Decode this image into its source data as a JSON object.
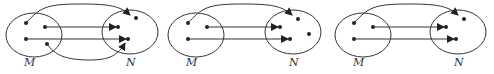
{
  "diagrams": [
    {
      "id": "diagram-1",
      "sets": {
        "M": {
          "label": "M",
          "cx": 34,
          "cy": 35,
          "rx": 28,
          "ry": 22,
          "label_pos": [
            24,
            66
          ],
          "points": [
            [
              26,
              23
            ],
            [
              45,
              27
            ],
            [
              26,
              39
            ],
            [
              47,
              44
            ]
          ]
        },
        "N": {
          "label": "N",
          "cx": 130,
          "cy": 32,
          "rx": 28,
          "ry": 22,
          "label_pos": [
            126,
            66
          ],
          "points": [
            [
              136,
              18
            ],
            [
              118,
              27
            ],
            [
              128,
              39
            ]
          ]
        }
      },
      "arrows": [
        {
          "from": [
            26,
            23
          ],
          "to": [
            130,
            15
          ],
          "path": "M26,23 C40,8 45,4 80,4 C110,4 120,6 130,15"
        },
        {
          "from": [
            45,
            27
          ],
          "to": [
            116,
            27
          ],
          "path": "M45,27 L116,27"
        },
        {
          "from": [
            26,
            39
          ],
          "to": [
            126,
            39
          ],
          "path": "M26,39 L126,39"
        },
        {
          "from": [
            47,
            44
          ],
          "to": [
            125,
            43
          ],
          "path": "M47,44 C55,55 65,60 90,60 C110,60 118,55 125,43"
        }
      ]
    },
    {
      "id": "diagram-2",
      "sets": {
        "M": {
          "label": "M",
          "cx": 196,
          "cy": 35,
          "rx": 28,
          "ry": 22,
          "label_pos": [
            186,
            66
          ],
          "points": [
            [
              188,
              23
            ],
            [
              207,
              27
            ],
            [
              188,
              39
            ]
          ]
        },
        "N": {
          "label": "N",
          "cx": 293,
          "cy": 32,
          "rx": 28,
          "ry": 22,
          "label_pos": [
            289,
            66
          ],
          "points": [
            [
              298,
              19
            ],
            [
              280,
              27
            ],
            [
              309,
              34
            ],
            [
              290,
              39
            ]
          ]
        }
      },
      "arrows": [
        {
          "from": [
            188,
            23
          ],
          "to": [
            292,
            15
          ],
          "path": "M188,23 C202,8 207,4 242,4 C272,4 282,6 292,15"
        },
        {
          "from": [
            207,
            27
          ],
          "to": [
            278,
            27
          ],
          "path": "M207,27 L278,27"
        },
        {
          "from": [
            188,
            39
          ],
          "to": [
            288,
            39
          ],
          "path": "M188,39 L288,39"
        }
      ]
    },
    {
      "id": "diagram-3",
      "sets": {
        "M": {
          "label": "M",
          "cx": 363,
          "cy": 35,
          "rx": 28,
          "ry": 22,
          "label_pos": [
            353,
            66
          ],
          "points": [
            [
              354,
              23
            ],
            [
              373,
              27
            ],
            [
              354,
              39
            ]
          ]
        },
        "N": {
          "label": "N",
          "cx": 458,
          "cy": 32,
          "rx": 28,
          "ry": 22,
          "label_pos": [
            454,
            66
          ],
          "points": [
            [
              464,
              19
            ],
            [
              446,
              27
            ],
            [
              456,
              39
            ]
          ]
        }
      },
      "arrows": [
        {
          "from": [
            354,
            23
          ],
          "to": [
            458,
            15
          ],
          "path": "M354,23 C368,8 373,4 408,4 C438,4 448,6 458,15"
        },
        {
          "from": [
            373,
            27
          ],
          "to": [
            444,
            27
          ],
          "path": "M373,27 L444,27"
        },
        {
          "from": [
            354,
            39
          ],
          "to": [
            454,
            39
          ],
          "path": "M354,39 L454,39"
        }
      ]
    }
  ],
  "colors": {
    "stroke": "#333333",
    "point": "#222222"
  }
}
